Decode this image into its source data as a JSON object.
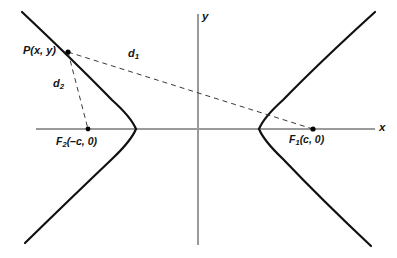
{
  "figure": {
    "width": 397,
    "height": 258,
    "background": "#ffffff"
  },
  "style": {
    "curve_color": "#111111",
    "axis_color": "#9a9a9a",
    "dashed_color": "#3a3a3a",
    "label_color": "#151515",
    "point_color": "#000000",
    "curve_width": 2.2,
    "axis_width": 2.0,
    "dash_width": 1.0,
    "dash_pattern": "5,4"
  },
  "axes": {
    "x_label": "x",
    "y_label": "y",
    "origin": {
      "x": 198,
      "y": 129
    },
    "x_axis": {
      "x1": 36,
      "y1": 129,
      "x2": 375,
      "y2": 129
    },
    "y_axis": {
      "x1": 198,
      "y1": 14,
      "x2": 198,
      "y2": 245
    }
  },
  "labels": {
    "point_p": "P(x, y)",
    "d1": "d",
    "d1_sub": "1",
    "d2": "d",
    "d2_sub": "2",
    "focus1": "F",
    "focus1_sub": "1",
    "focus1_coords": "(c, 0)",
    "focus2": "F",
    "focus2_sub": "2",
    "focus2_coords": "(–c, 0)"
  },
  "chart_data": {
    "type": "line",
    "xlabel": "x",
    "ylabel": "y",
    "grid": false,
    "legend": "none",
    "annotations": [
      "P(x, y)",
      "d1",
      "d2",
      "F1(c, 0)",
      "F2(–c, 0)"
    ],
    "points": [
      {
        "name": "P",
        "label": "P(x, y)",
        "px": 68,
        "py": 52
      },
      {
        "name": "F1",
        "label": "F1(c, 0)",
        "px": 313,
        "py": 129
      },
      {
        "name": "F2",
        "label": "F2(–c, 0)",
        "px": 88,
        "py": 129
      },
      {
        "name": "center",
        "label": "origin",
        "px": 198,
        "py": 129
      },
      {
        "name": "vertex_left",
        "label": "(–a, 0)",
        "px": 136,
        "py": 129
      },
      {
        "name": "vertex_right",
        "label": "(a, 0)",
        "px": 259,
        "py": 129
      }
    ],
    "series": [
      {
        "name": "left-branch",
        "path": "M 22 12 Q 74 61 112 100 Q 131 117 136 129 Q 131 141 112 159 Q 70 199 25 243"
      },
      {
        "name": "right-branch",
        "path": "M 375 12 Q 320 62 283 100 Q 264 117 259 129 Q 264 141 283 159 Q 322 200 371 246"
      }
    ],
    "segments": [
      {
        "name": "d1",
        "from": "P",
        "to": "F1",
        "style": "dashed",
        "x1": 68,
        "y1": 52,
        "x2": 313,
        "y2": 129
      },
      {
        "name": "d2",
        "from": "P",
        "to": "F2",
        "style": "dashed",
        "x1": 68,
        "y1": 52,
        "x2": 88,
        "y2": 129
      }
    ]
  }
}
